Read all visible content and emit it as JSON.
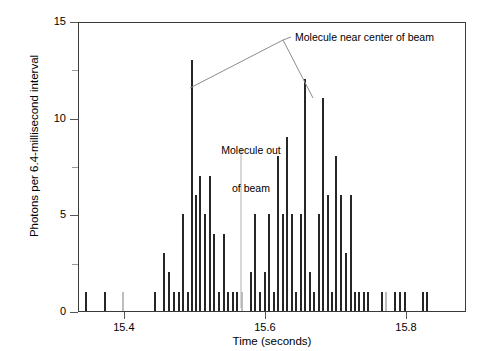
{
  "chart_data": {
    "type": "bar",
    "title": "",
    "xlabel": "Time (seconds)",
    "ylabel": "Photons per 6.4-millisecond interval",
    "xlim": [
      15.335,
      15.885
    ],
    "ylim": [
      0,
      15
    ],
    "xticks": [
      15.4,
      15.6,
      15.8
    ],
    "xticklabels": [
      "15.4",
      "15.6",
      "15.8"
    ],
    "yticks": [
      0,
      5,
      10,
      15
    ],
    "yticklabels": [
      "0",
      "5",
      "10",
      "15"
    ],
    "yminorticks": [
      2.5,
      7.5,
      12.5
    ],
    "grid": false,
    "legend": null,
    "bin_width_seconds": 0.0064,
    "bar_color": "#262626",
    "faint_bar_color": "#bdbdbd",
    "annotations": [
      {
        "id": "molecule-near-center",
        "text": "Molecule near center of beam",
        "points_to": [
          15.495,
          15.668
        ]
      },
      {
        "id": "molecule-out-of-beam",
        "text_lines": [
          "Molecule out",
          "of beam"
        ],
        "points_to": [
          15.566
        ]
      }
    ],
    "x": [
      15.345,
      15.372,
      15.398,
      15.443,
      15.456,
      15.463,
      15.47,
      15.477,
      15.483,
      15.49,
      15.495,
      15.501,
      15.507,
      15.514,
      15.52,
      15.527,
      15.533,
      15.54,
      15.546,
      15.553,
      15.559,
      15.566,
      15.579,
      15.585,
      15.592,
      15.598,
      15.605,
      15.611,
      15.617,
      15.624,
      15.63,
      15.637,
      15.643,
      15.649,
      15.656,
      15.662,
      15.668,
      15.675,
      15.681,
      15.688,
      15.694,
      15.7,
      15.707,
      15.713,
      15.72,
      15.726,
      15.732,
      15.739,
      15.745,
      15.764,
      15.77,
      15.783,
      15.79,
      15.797,
      15.822,
      15.829
    ],
    "values": [
      1,
      1,
      1,
      1,
      3,
      2,
      1,
      1,
      5,
      1,
      13,
      6,
      7,
      5,
      7,
      4,
      1,
      4,
      1,
      1,
      1,
      1,
      2,
      5,
      1,
      2,
      5,
      1,
      8,
      5,
      9,
      5,
      1,
      5,
      12,
      2,
      1,
      5,
      11,
      6,
      1,
      8,
      6,
      3,
      6,
      1,
      1,
      1,
      1,
      1,
      1,
      1,
      1,
      1,
      1,
      1
    ],
    "faint_bars": [
      {
        "x": 15.398,
        "value": 1
      },
      {
        "x": 15.566,
        "value": 1
      },
      {
        "x": 15.77,
        "value": 1
      }
    ]
  }
}
